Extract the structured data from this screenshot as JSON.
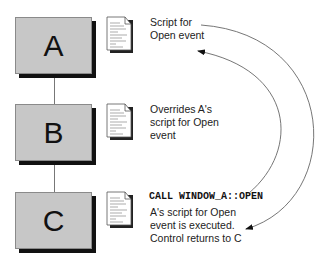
{
  "diagram": {
    "nodes": [
      {
        "id": "A",
        "label": "A",
        "description": [
          "Script for",
          "Open event"
        ]
      },
      {
        "id": "B",
        "label": "B",
        "description": [
          "Overrides A's",
          "script for Open",
          "event"
        ]
      },
      {
        "id": "C",
        "label": "C",
        "code": "CALL WINDOW_A::OPEN",
        "description": [
          "A's script for Open",
          "event is executed.",
          "Control returns to C"
        ]
      }
    ],
    "edges": [
      {
        "from": "A",
        "to": "B",
        "type": "inheritance-line"
      },
      {
        "from": "B",
        "to": "C",
        "type": "inheritance-line"
      },
      {
        "from": "C.call",
        "to": "A.script",
        "type": "arrow",
        "meaning": "call ancestor script"
      },
      {
        "from": "A.script",
        "to": "C.after",
        "type": "arrow",
        "meaning": "control returns"
      }
    ],
    "icons": [
      "script-document-icon",
      "script-document-icon",
      "script-document-icon"
    ],
    "colors": {
      "box_fill": "#c7c7c7",
      "box_shadow": "#111111",
      "line": "#777777"
    }
  }
}
